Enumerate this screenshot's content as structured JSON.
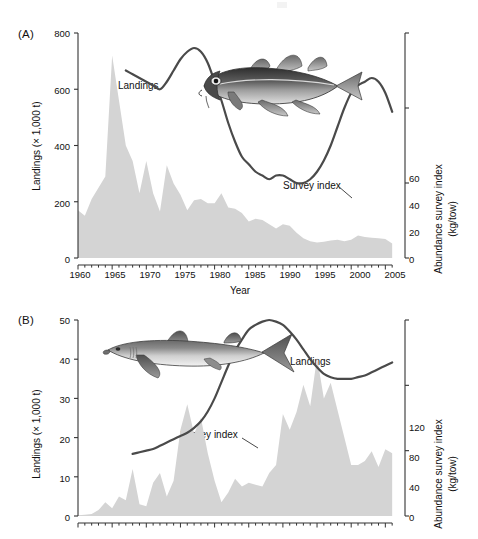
{
  "figure": {
    "background": "#ffffff",
    "area_fill_color": "#d4d4d4",
    "line_color": "#4a4a4a",
    "axis_color": "#333333"
  },
  "panels": [
    {
      "letter": "(A)",
      "species_icon": "atlantic-cod-fish-icon",
      "landings_label": "Landings",
      "survey_label": "Survey index",
      "xlabel": "Year",
      "ylabel_left": "Landings (× 1,000 t)",
      "ylabel_right_line1": "Abundance survey index",
      "ylabel_right_line2": "(kg/tow)",
      "yticks_left": [
        "0",
        "200",
        "400",
        "600",
        "800"
      ],
      "yticks_right": [
        "0",
        "20",
        "40",
        "60"
      ],
      "xticks": [
        "1960",
        "1965",
        "1970",
        "1975",
        "1980",
        "1985",
        "1990",
        "1995",
        "2000",
        "2005"
      ]
    },
    {
      "letter": "(B)",
      "species_icon": "spiny-dogfish-shark-icon",
      "landings_label": "Landings",
      "survey_label": "Survey index",
      "xlabel": "",
      "ylabel_left": "Landings (× 1,000 t)",
      "ylabel_right_line1": "Abundance survey index",
      "ylabel_right_line2": "(kg/tow)",
      "yticks_left": [
        "0",
        "10",
        "20",
        "30",
        "40",
        "50"
      ],
      "yticks_right": [
        "0",
        "40",
        "80",
        "120"
      ],
      "xticks": []
    }
  ],
  "chart_data": [
    {
      "type": "area",
      "panel": "A",
      "title": "",
      "xlabel": "Year",
      "ylabel": "Landings (× 1,000 t)",
      "ylabel_secondary": "Abundance survey index (kg/tow)",
      "xlim": [
        1960,
        2007
      ],
      "ylim": [
        0,
        800
      ],
      "ylim_secondary": [
        0,
        60
      ],
      "grid": false,
      "legend": "inline-annotations",
      "series": [
        {
          "name": "Landings",
          "axis": "left",
          "units": "thousand tonnes",
          "render": "filled-area",
          "x": [
            1960,
            1961,
            1962,
            1963,
            1964,
            1965,
            1966,
            1967,
            1968,
            1969,
            1970,
            1971,
            1972,
            1973,
            1974,
            1975,
            1976,
            1977,
            1978,
            1979,
            1980,
            1981,
            1982,
            1983,
            1984,
            1985,
            1986,
            1987,
            1988,
            1989,
            1990,
            1991,
            1992,
            1993,
            1994,
            1995,
            1996,
            1997,
            1998,
            1999,
            2000,
            2001,
            2002,
            2003,
            2004,
            2005,
            2006
          ],
          "values": [
            170,
            150,
            210,
            250,
            290,
            720,
            560,
            400,
            345,
            230,
            345,
            230,
            165,
            330,
            265,
            225,
            170,
            205,
            210,
            195,
            195,
            230,
            180,
            175,
            160,
            130,
            140,
            135,
            120,
            105,
            120,
            115,
            90,
            70,
            60,
            55,
            58,
            62,
            65,
            60,
            65,
            80,
            75,
            72,
            70,
            68,
            52
          ]
        },
        {
          "name": "Survey index",
          "axis": "right",
          "units": "kg/tow",
          "render": "line",
          "x": [
            1967,
            1968,
            1969,
            1970,
            1971,
            1972,
            1973,
            1974,
            1975,
            1976,
            1977,
            1978,
            1979,
            1980,
            1981,
            1982,
            1983,
            1984,
            1985,
            1986,
            1987,
            1988,
            1989,
            1990,
            1991,
            1992,
            1993,
            1994,
            1995,
            1996,
            1997,
            1998,
            1999,
            2000,
            2001,
            2002,
            2003,
            2004,
            2005,
            2006
          ],
          "values": [
            50,
            49,
            48,
            47,
            46,
            45,
            47,
            50,
            53,
            55,
            56,
            55,
            52,
            47,
            42,
            36,
            31,
            27,
            25,
            23,
            22,
            21,
            22,
            22,
            21,
            20,
            20,
            21,
            23,
            26,
            30,
            35,
            40,
            44,
            46,
            47,
            48,
            47,
            44,
            39
          ]
        }
      ]
    },
    {
      "type": "area",
      "panel": "B",
      "title": "",
      "xlabel": "",
      "ylabel": "Landings (× 1,000 t)",
      "ylabel_secondary": "Abundance survey index (kg/tow)",
      "xlim": [
        1960,
        2007
      ],
      "ylim": [
        0,
        50
      ],
      "ylim_secondary": [
        0,
        120
      ],
      "grid": false,
      "legend": "inline-annotations",
      "series": [
        {
          "name": "Landings",
          "axis": "left",
          "units": "thousand tonnes",
          "render": "filled-area",
          "x": [
            1960,
            1961,
            1962,
            1963,
            1964,
            1965,
            1966,
            1967,
            1968,
            1969,
            1970,
            1971,
            1972,
            1973,
            1974,
            1975,
            1976,
            1977,
            1978,
            1979,
            1980,
            1981,
            1982,
            1983,
            1984,
            1985,
            1986,
            1987,
            1988,
            1989,
            1990,
            1991,
            1992,
            1993,
            1994,
            1995,
            1996,
            1997,
            1998,
            1999,
            2000,
            2001,
            2002,
            2003,
            2004,
            2005,
            2006
          ],
          "values": [
            0.2,
            0.3,
            0.5,
            1.5,
            3.5,
            2.0,
            5.0,
            4.0,
            12.0,
            3.0,
            2.5,
            8.5,
            11.0,
            5.0,
            9.0,
            22.0,
            28.5,
            21.0,
            25.0,
            16.0,
            9.0,
            3.5,
            6.0,
            9.5,
            7.5,
            8.5,
            8.0,
            7.5,
            11.0,
            13.0,
            26.0,
            22.0,
            26.5,
            33.5,
            28.0,
            40.5,
            30.0,
            34.0,
            27.0,
            20.0,
            13.0,
            13.0,
            14.0,
            16.5,
            12.5,
            17.0,
            16.0
          ]
        },
        {
          "name": "Survey index",
          "axis": "right",
          "units": "kg/tow",
          "render": "line",
          "x": [
            1968,
            1969,
            1970,
            1971,
            1972,
            1973,
            1974,
            1975,
            1976,
            1977,
            1978,
            1979,
            1980,
            1981,
            1982,
            1983,
            1984,
            1985,
            1986,
            1987,
            1988,
            1989,
            1990,
            1991,
            1992,
            1993,
            1994,
            1995,
            1996,
            1997,
            1998,
            1999,
            2000,
            2001,
            2002,
            2003,
            2004,
            2005,
            2006
          ],
          "values": [
            38,
            39,
            40,
            41,
            43,
            45,
            47,
            49,
            51,
            54,
            58,
            64,
            72,
            82,
            92,
            101,
            108,
            114,
            117,
            119,
            120,
            119,
            117,
            113,
            108,
            102,
            96,
            91,
            87,
            85,
            84,
            84,
            84,
            85,
            86,
            88,
            90,
            92,
            94
          ]
        }
      ]
    }
  ]
}
